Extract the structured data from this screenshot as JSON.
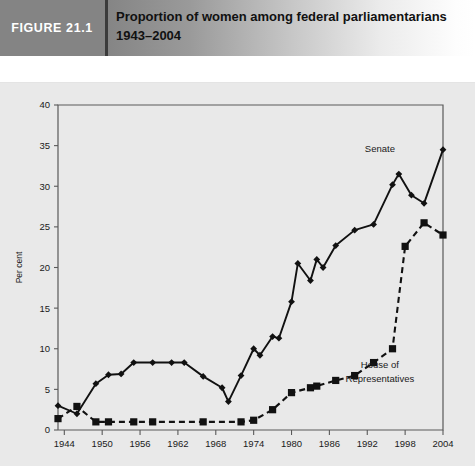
{
  "figure": {
    "tag": "FIGURE 21.1",
    "title_line1": "Proportion of women among federal parliamentarians",
    "title_line2": "1943–2004"
  },
  "colors": {
    "tag_background": "#848484",
    "panel_background": "#e9e9e9",
    "ink": "#111111",
    "axis": "#5a5a5a"
  },
  "chart_data": {
    "type": "line",
    "title": "Proportion of women among federal parliamentarians 1943–2004",
    "xlabel": "",
    "ylabel": "Per cent",
    "xlim": [
      1943,
      2004
    ],
    "ylim": [
      0,
      40
    ],
    "ytick_step": 5,
    "yticks": [
      0,
      5,
      10,
      15,
      20,
      25,
      30,
      35,
      40
    ],
    "xticks": [
      1944,
      1950,
      1956,
      1962,
      1968,
      1974,
      1980,
      1986,
      1992,
      1998,
      2004
    ],
    "grid": false,
    "legend": "inline-annotations",
    "series": [
      {
        "name": "Senate",
        "label": "Senate",
        "style": "solid",
        "marker": "diamond",
        "x": [
          1943,
          1946,
          1949,
          1951,
          1953,
          1955,
          1958,
          1961,
          1963,
          1966,
          1969,
          1970,
          1972,
          1974,
          1975,
          1977,
          1978,
          1980,
          1981,
          1983,
          1984,
          1985,
          1987,
          1990,
          1993,
          1996,
          1997,
          1999,
          2001,
          2004
        ],
        "y": [
          3.0,
          2.0,
          5.7,
          6.8,
          6.9,
          8.3,
          8.3,
          8.3,
          8.3,
          6.6,
          5.2,
          3.5,
          6.7,
          10.0,
          9.2,
          11.5,
          11.3,
          15.8,
          20.5,
          18.4,
          21.0,
          20.0,
          22.7,
          24.6,
          25.3,
          30.2,
          31.5,
          28.9,
          27.9,
          34.5
        ]
      },
      {
        "name": "House of Representatives",
        "label": "House of Representatives",
        "style": "dashed",
        "marker": "square",
        "x": [
          1943,
          1946,
          1949,
          1951,
          1955,
          1958,
          1966,
          1972,
          1974,
          1977,
          1980,
          1983,
          1984,
          1987,
          1990,
          1993,
          1996,
          1998,
          2001,
          2004
        ],
        "y": [
          1.4,
          2.9,
          1.0,
          1.0,
          1.0,
          1.0,
          1.0,
          1.0,
          1.2,
          2.5,
          4.6,
          5.2,
          5.4,
          6.1,
          6.7,
          8.3,
          10.0,
          22.6,
          25.5,
          24.0
        ]
      }
    ],
    "annotations": [
      {
        "text": "Senate",
        "x": 1994,
        "y": 34.2
      },
      {
        "text": "House of",
        "x": 1994,
        "y": 7.6
      },
      {
        "text": "Representatives",
        "x": 1994,
        "y": 5.9
      }
    ]
  }
}
